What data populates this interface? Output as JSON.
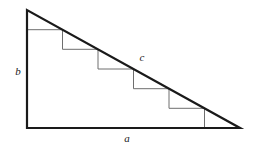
{
  "figure": {
    "name": "right-triangle-staircase",
    "canvas": {
      "width": 255,
      "height": 151,
      "background": "#ffffff"
    },
    "style": {
      "outline_color": "#1a1a1a",
      "outline_width": 2.2,
      "staircase_color": "#6e6e6e",
      "staircase_width": 1,
      "label_color": "#1a1a1a",
      "label_font_size": 11
    },
    "vertices": {
      "apex": {
        "x": 27,
        "y": 10
      },
      "bottom_left": {
        "x": 27,
        "y": 128
      },
      "bottom_right": {
        "x": 240,
        "y": 128
      }
    },
    "outline_path": "M 27 10 L 27 128 L 240 128 L 27 10 Z",
    "staircase": {
      "step_count": 6,
      "run": 35.5,
      "rise": 19.67,
      "path": "M 27 29.7 L 62.5 29.7 L 62.5 49.3 L 98 49.3 L 98 69 L 133.5 69 L 133.5 88.7 L 169 88.7 L 169 108.3 L 204.5 108.3 L 204.5 128"
    },
    "labels": [
      {
        "id": "leg-b",
        "text": "b",
        "x": 18,
        "y": 72,
        "side": "vertical-leg"
      },
      {
        "id": "hypotenuse-c",
        "text": "c",
        "x": 142,
        "y": 58,
        "side": "hypotenuse"
      },
      {
        "id": "leg-a",
        "text": "a",
        "x": 127,
        "y": 139,
        "side": "horizontal-leg"
      }
    ]
  }
}
